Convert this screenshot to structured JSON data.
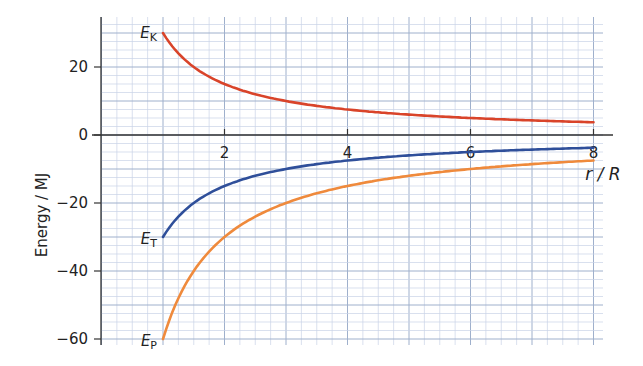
{
  "chart_data": {
    "type": "line",
    "title": "",
    "xlabel": "r / R",
    "ylabel": "Energy / MJ",
    "xlim": [
      0,
      8.2
    ],
    "ylim": [
      -62,
      34
    ],
    "grid": true,
    "xticks": [
      2,
      4,
      6,
      8
    ],
    "yticks": [
      20,
      0,
      -20,
      -40,
      -60
    ],
    "series": [
      {
        "name": "E_K",
        "label_main": "E",
        "label_sub": "K",
        "color": "#d9442a",
        "x": [
          1,
          1.25,
          1.5,
          2,
          2.5,
          3,
          4,
          5,
          6,
          7,
          8
        ],
        "y": [
          30,
          24,
          20,
          15,
          12,
          10,
          7.5,
          6,
          5,
          4.3,
          3.75
        ]
      },
      {
        "name": "E_T",
        "label_main": "E",
        "label_sub": "T",
        "color": "#2f4f9a",
        "x": [
          1,
          1.25,
          1.5,
          2,
          2.5,
          3,
          4,
          5,
          6,
          7,
          8
        ],
        "y": [
          -30,
          -24,
          -20,
          -15,
          -12,
          -10,
          -7.5,
          -6,
          -5,
          -4.3,
          -3.75
        ]
      },
      {
        "name": "E_P",
        "label_main": "E",
        "label_sub": "P",
        "color": "#ef8a3c",
        "x": [
          1,
          1.25,
          1.5,
          2,
          2.5,
          3,
          4,
          5,
          6,
          7,
          8
        ],
        "y": [
          -60,
          -48,
          -40,
          -30,
          -24,
          -20,
          -15,
          -12,
          -10,
          -8.6,
          -7.5
        ]
      }
    ]
  }
}
